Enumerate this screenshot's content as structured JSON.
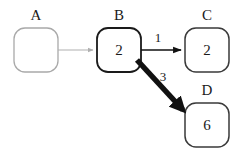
{
  "diagram": {
    "type": "directed-graph",
    "background_color": "#ffffff",
    "nodes": [
      {
        "id": "A",
        "label": "A",
        "value": "",
        "x": 14,
        "y": 28,
        "width": 44,
        "height": 44,
        "border_color": "#a9a9a9",
        "border_width": 1.3,
        "text_color": "#1a1a1a"
      },
      {
        "id": "B",
        "label": "B",
        "value": "2",
        "x": 97,
        "y": 28,
        "width": 44,
        "height": 44,
        "border_color": "#1a1a1a",
        "border_width": 1.8,
        "text_color": "#1a1a1a"
      },
      {
        "id": "C",
        "label": "C",
        "value": "2",
        "x": 185,
        "y": 28,
        "width": 44,
        "height": 44,
        "border_color": "#3a3a3a",
        "border_width": 1.5,
        "text_color": "#1a1a1a"
      },
      {
        "id": "D",
        "label": "D",
        "value": "6",
        "x": 185,
        "y": 103,
        "width": 44,
        "height": 44,
        "border_color": "#3a3a3a",
        "border_width": 1.5,
        "text_color": "#1a1a1a"
      }
    ],
    "edges": [
      {
        "id": "A-B",
        "from": "A",
        "to": "B",
        "label": "",
        "color": "#b0b0b0",
        "width": 1.2,
        "x1": 58,
        "y1": 50,
        "x2": 95,
        "y2": 50
      },
      {
        "id": "B-C",
        "from": "B",
        "to": "C",
        "label": "1",
        "color": "#111111",
        "width": 1.6,
        "x1": 141,
        "y1": 50,
        "x2": 183,
        "y2": 50
      },
      {
        "id": "B-D",
        "from": "B",
        "to": "D",
        "label": "3",
        "color": "#111111",
        "width": 5.5,
        "x1": 137,
        "y1": 60,
        "x2": 187,
        "y2": 114
      }
    ]
  }
}
